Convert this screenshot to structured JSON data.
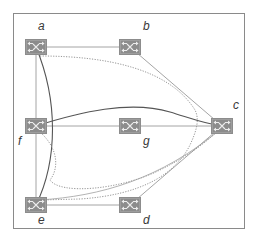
{
  "diagram": {
    "type": "network-topology",
    "frame": {
      "x": 13,
      "y": 13,
      "width": 231,
      "height": 215,
      "stroke": "#8a8a8a"
    },
    "colors": {
      "node_fill": "#8c8c8c",
      "node_glyph": "#e6e6e6",
      "link_light": "#9a9a9a",
      "link_dark": "#555555",
      "link_dotted": "#8a8a8a",
      "label": "#3a3a3a"
    },
    "nodes": [
      {
        "id": "a",
        "label": "a",
        "x": 36,
        "y": 47
      },
      {
        "id": "b",
        "label": "b",
        "x": 130,
        "y": 47
      },
      {
        "id": "c",
        "label": "c",
        "x": 222,
        "y": 126
      },
      {
        "id": "f",
        "label": "f",
        "x": 36,
        "y": 126
      },
      {
        "id": "g",
        "label": "g",
        "x": 130,
        "y": 126
      },
      {
        "id": "e",
        "label": "e",
        "x": 36,
        "y": 205
      },
      {
        "id": "d",
        "label": "d",
        "x": 130,
        "y": 205
      }
    ],
    "links": [
      {
        "from": "a",
        "to": "b",
        "style": "straight"
      },
      {
        "from": "a",
        "to": "f",
        "style": "straight"
      },
      {
        "from": "f",
        "to": "e",
        "style": "straight"
      },
      {
        "from": "f",
        "to": "g",
        "style": "straight"
      },
      {
        "from": "g",
        "to": "c",
        "style": "straight"
      },
      {
        "from": "e",
        "to": "d",
        "style": "straight"
      },
      {
        "from": "b",
        "to": "c",
        "style": "straight"
      },
      {
        "from": "d",
        "to": "c",
        "style": "straight"
      }
    ],
    "paths": [
      {
        "name": "path-a-e-solid",
        "from": "a",
        "to": "e",
        "style": "solid-dark"
      },
      {
        "name": "path-f-c-solid",
        "from": "f",
        "to": "c",
        "style": "solid-dark"
      },
      {
        "name": "path-a-c-dotted",
        "from": "a",
        "to": "c",
        "style": "dotted"
      },
      {
        "name": "path-f-c-dotted",
        "from": "f",
        "to": "c",
        "style": "dotted"
      },
      {
        "name": "path-e-c-thin",
        "from": "e",
        "to": "c",
        "style": "solid-light"
      }
    ]
  }
}
